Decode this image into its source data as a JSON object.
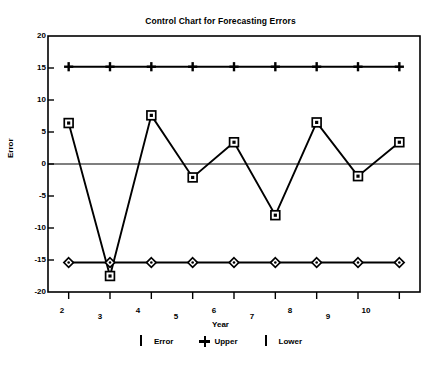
{
  "chart_data": {
    "type": "line",
    "title": "Control Chart for Forecasting Errors",
    "xlabel": "Year",
    "ylabel": "Error",
    "x": [
      2,
      3,
      4,
      5,
      6,
      7,
      8,
      9,
      10
    ],
    "xlim": [
      1.5,
      10.5
    ],
    "ylim": [
      -20,
      20
    ],
    "xticks": [
      "2",
      "3",
      "4",
      "5",
      "6",
      "7",
      "8",
      "9",
      "10"
    ],
    "yticks": [
      "20",
      "15",
      "10",
      "5",
      "0",
      "-5",
      "-10",
      "-15",
      "-20"
    ],
    "grid": false,
    "legend_position": "bottom",
    "zero_line": 0,
    "series": [
      {
        "name": "Error",
        "marker": "square",
        "values": [
          6.4,
          -17.5,
          7.6,
          -2.1,
          3.4,
          -8.0,
          6.5,
          -1.9,
          3.4
        ]
      },
      {
        "name": "Upper",
        "marker": "plus",
        "values": [
          15.2,
          15.2,
          15.2,
          15.2,
          15.2,
          15.2,
          15.2,
          15.2,
          15.2
        ]
      },
      {
        "name": "Lower",
        "marker": "diamond",
        "values": [
          -15.4,
          -15.4,
          -15.4,
          -15.4,
          -15.4,
          -15.4,
          -15.4,
          -15.4,
          -15.4
        ]
      }
    ],
    "colors": {
      "line": "#000000",
      "background": "#ffffff",
      "axis": "#000000"
    }
  },
  "legend": {
    "items": [
      {
        "label": "Error",
        "symbol": "square-marker"
      },
      {
        "label": "Upper",
        "symbol": "plus-marker"
      },
      {
        "label": "Lower",
        "symbol": "diamond-marker"
      }
    ]
  }
}
